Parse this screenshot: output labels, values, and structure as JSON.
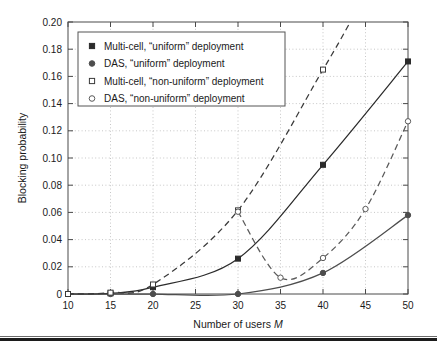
{
  "chart_data": {
    "type": "line",
    "title": "",
    "xlabel": "Number of users M",
    "xlabel_plain": "Number of users",
    "xlabel_italic": "M",
    "ylabel": "Blocking probability",
    "xlim": [
      10,
      50
    ],
    "ylim": [
      0,
      0.2
    ],
    "xticks": [
      10,
      15,
      20,
      25,
      30,
      35,
      40,
      45,
      50
    ],
    "yticks": [
      0,
      0.02,
      0.04,
      0.06,
      0.08,
      0.1,
      0.12,
      0.14,
      0.16,
      0.18,
      0.2
    ],
    "xtick_labels": [
      "10",
      "15",
      "20",
      "25",
      "30",
      "35",
      "40",
      "45",
      "50"
    ],
    "ytick_labels": [
      "0",
      "0.02",
      "0.04",
      "0.06",
      "0.08",
      "0.10",
      "0.12",
      "0.14",
      "0.16",
      "0.18",
      "0.20"
    ],
    "grid": true,
    "grid_style": "dotted",
    "legend_position": "upper-left",
    "series": [
      {
        "name": "Multi-cell, “uniform” deployment",
        "marker": "filled-square",
        "line": "solid",
        "color": "#2b2b2b",
        "x": [
          10,
          15,
          20,
          30,
          40,
          50
        ],
        "values": [
          0.0,
          0.0005,
          0.005,
          0.026,
          0.095,
          0.171
        ]
      },
      {
        "name": "DAS, “uniform” deployment",
        "marker": "filled-circle",
        "line": "solid",
        "color": "#4d4d4d",
        "x": [
          10,
          15,
          20,
          30,
          40,
          50
        ],
        "values": [
          0.0,
          0.0,
          0.0,
          0.0,
          0.0155,
          0.058
        ]
      },
      {
        "name": "Multi-cell, “non-uniform” deployment",
        "marker": "open-square",
        "line": "dashed",
        "color": "#3a3a3a",
        "x": [
          10,
          15,
          20,
          30,
          40
        ],
        "values": [
          0.0,
          0.001,
          0.007,
          0.0615,
          0.165
        ]
      },
      {
        "name": "DAS, “non-uniform” deployment",
        "marker": "open-circle",
        "line": "dashed",
        "color": "#5a5a5a",
        "x": [
          30,
          35,
          40,
          45,
          50
        ],
        "values": [
          0.0605,
          0.012,
          0.0265,
          0.0625,
          0.127
        ]
      }
    ]
  },
  "legend": {
    "items": [
      {
        "label": "Multi-cell, “uniform” deployment",
        "marker": "filled-square"
      },
      {
        "label": "DAS, “uniform” deployment",
        "marker": "filled-circle"
      },
      {
        "label": "Multi-cell, “non-uniform” deployment",
        "marker": "open-square"
      },
      {
        "label": "DAS, “non-uniform” deployment",
        "marker": "open-circle"
      }
    ]
  },
  "colors": {
    "background": "#ffffff",
    "axis": "#4a4a4a",
    "grid": "#b9b9b9",
    "text": "#1a1a1a",
    "rule": "#1c1c1c"
  }
}
